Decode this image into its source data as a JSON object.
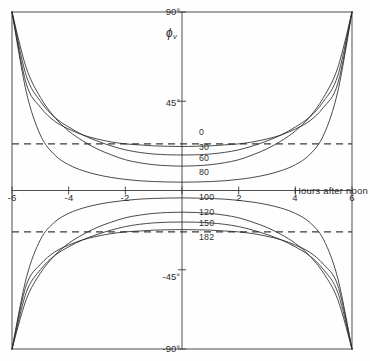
{
  "chart_data": {
    "type": "line",
    "title": "",
    "xlabel": "Hours after noon",
    "ylabel": "ϕv",
    "xlim": [
      -6,
      6
    ],
    "ylim": [
      -90,
      90
    ],
    "xticks": [
      -6,
      -4,
      -2,
      0,
      2,
      4,
      6
    ],
    "xtick_labels": [
      "-6",
      "-4",
      "-2",
      "",
      "2",
      "4",
      "6"
    ],
    "yticks": [
      90,
      45,
      -45,
      -90
    ],
    "ytick_labels": [
      "90°",
      "45°",
      "-45°",
      "-90°"
    ],
    "grid": false,
    "legend": "inline-curve-labels",
    "reference_lines": [
      {
        "name": "upper-dashed",
        "y": 23.5,
        "style": "dashed"
      },
      {
        "name": "lower-dashed",
        "y": -23.5,
        "style": "dashed"
      }
    ],
    "series": [
      {
        "name": "0",
        "label": "0",
        "x": [
          -6,
          -5.5,
          -5,
          -4.5,
          -4,
          -3.5,
          -3,
          -2.5,
          -2,
          -1.5,
          -1,
          -0.5,
          0,
          0.5,
          1,
          1.5,
          2,
          2.5,
          3,
          3.5,
          4,
          4.5,
          5,
          5.5,
          6
        ],
        "values": [
          90,
          54,
          42,
          35,
          31,
          28,
          26,
          24.5,
          23.5,
          23,
          22.5,
          22.3,
          22.2,
          22.3,
          22.5,
          23,
          23.5,
          24.5,
          26,
          28,
          31,
          35,
          42,
          54,
          90
        ]
      },
      {
        "name": "30",
        "label": "30",
        "x": [
          -6,
          -5.5,
          -5,
          -4.5,
          -4,
          -3.5,
          -3,
          -2.5,
          -2,
          -1.5,
          -1,
          -0.5,
          0,
          0.5,
          1,
          1.5,
          2,
          2.5,
          3,
          3.5,
          4,
          4.5,
          5,
          5.5,
          6
        ],
        "values": [
          90,
          58,
          45,
          37,
          32,
          28,
          25,
          22.5,
          20.5,
          19.2,
          18.4,
          18,
          17.9,
          18,
          18.4,
          19.2,
          20.5,
          22.5,
          25,
          28,
          32,
          37,
          45,
          58,
          90
        ]
      },
      {
        "name": "60",
        "label": "60",
        "x": [
          -6,
          -5.5,
          -5,
          -4.5,
          -4,
          -3.5,
          -3,
          -2.5,
          -2,
          -1.5,
          -1,
          -0.5,
          0,
          0.5,
          1,
          1.5,
          2,
          2.5,
          3,
          3.5,
          4,
          4.5,
          5,
          5.5,
          6
        ],
        "values": [
          90,
          62,
          47,
          37,
          30,
          25,
          21,
          18,
          15.5,
          14,
          13,
          12.5,
          12.3,
          12.5,
          13,
          14,
          15.5,
          18,
          21,
          25,
          30,
          37,
          47,
          62,
          90
        ]
      },
      {
        "name": "80",
        "label": "80",
        "x": [
          -6,
          -5.5,
          -5,
          -4.5,
          -4,
          -3.5,
          -3,
          -2.5,
          -2,
          -1.5,
          -1,
          -0.5,
          0,
          0.5,
          1,
          1.5,
          2,
          2.5,
          3,
          3.5,
          4,
          4.5,
          5,
          5.5,
          6
        ],
        "values": [
          90,
          50,
          28,
          18,
          13,
          10,
          8,
          6.6,
          5.6,
          4.9,
          4.5,
          4.3,
          4.2,
          4.3,
          4.5,
          4.9,
          5.6,
          6.6,
          8,
          10,
          13,
          18,
          28,
          50,
          90
        ]
      },
      {
        "name": "100",
        "label": "100",
        "x": [
          -6,
          -5.5,
          -5,
          -4.5,
          -4,
          -3.5,
          -3,
          -2.5,
          -2,
          -1.5,
          -1,
          -0.5,
          0,
          0.5,
          1,
          1.5,
          2,
          2.5,
          3,
          3.5,
          4,
          4.5,
          5,
          5.5,
          6
        ],
        "values": [
          -90,
          -50,
          -28,
          -18,
          -13,
          -10,
          -8,
          -6.6,
          -5.6,
          -4.9,
          -4.5,
          -4.3,
          -4.2,
          -4.3,
          -4.5,
          -4.9,
          -5.6,
          -6.6,
          -8,
          -10,
          -13,
          -18,
          -28,
          -50,
          -90
        ]
      },
      {
        "name": "120",
        "label": "120",
        "x": [
          -6,
          -5.5,
          -5,
          -4.5,
          -4,
          -3.5,
          -3,
          -2.5,
          -2,
          -1.5,
          -1,
          -0.5,
          0,
          0.5,
          1,
          1.5,
          2,
          2.5,
          3,
          3.5,
          4,
          4.5,
          5,
          5.5,
          6
        ],
        "values": [
          -90,
          -62,
          -47,
          -37,
          -30,
          -25,
          -21,
          -18,
          -15.5,
          -14,
          -13,
          -12.5,
          -12.3,
          -12.5,
          -13,
          -14,
          -15.5,
          -18,
          -21,
          -25,
          -30,
          -37,
          -47,
          -62,
          -90
        ]
      },
      {
        "name": "150",
        "label": "150",
        "x": [
          -6,
          -5.5,
          -5,
          -4.5,
          -4,
          -3.5,
          -3,
          -2.5,
          -2,
          -1.5,
          -1,
          -0.5,
          0,
          0.5,
          1,
          1.5,
          2,
          2.5,
          3,
          3.5,
          4,
          4.5,
          5,
          5.5,
          6
        ],
        "values": [
          -90,
          -58,
          -45,
          -37,
          -32,
          -28,
          -25,
          -22.5,
          -20.5,
          -19.2,
          -18.4,
          -18,
          -17.9,
          -18,
          -18.4,
          -19.2,
          -20.5,
          -22.5,
          -25,
          -28,
          -32,
          -37,
          -45,
          -58,
          -90
        ]
      },
      {
        "name": "182",
        "label": "182",
        "x": [
          -6,
          -5.5,
          -5,
          -4.5,
          -4,
          -3.5,
          -3,
          -2.5,
          -2,
          -1.5,
          -1,
          -0.5,
          0,
          0.5,
          1,
          1.5,
          2,
          2.5,
          3,
          3.5,
          4,
          4.5,
          5,
          5.5,
          6
        ],
        "values": [
          -90,
          -54,
          -42,
          -35,
          -31,
          -28,
          -26,
          -24.5,
          -23.5,
          -23,
          -22.5,
          -22.3,
          -22.2,
          -22.3,
          -22.5,
          -23,
          -23.5,
          -24.5,
          -26,
          -28,
          -31,
          -35,
          -42,
          -54,
          -90
        ]
      }
    ]
  },
  "axes": {
    "y_label": "ϕ",
    "y_label_sub": "v",
    "x_title": "Hours after noon",
    "tick_90": "90°",
    "tick_45": "45°",
    "tick_m45": "-45°",
    "tick_m90": "-90°",
    "tick_m6": "-6",
    "tick_m4": "-4",
    "tick_m2": "-2",
    "tick_2": "2",
    "tick_4": "4",
    "tick_6": "6"
  },
  "curve_labels": {
    "c0": "0",
    "c30": "30",
    "c60": "60",
    "c80": "80",
    "c100": "100",
    "c120": "120",
    "c150": "150",
    "c182": "182"
  },
  "style": {
    "line_color": "#2b2b2b",
    "axis_color": "#3a3a3a",
    "background": "#fefefe"
  }
}
